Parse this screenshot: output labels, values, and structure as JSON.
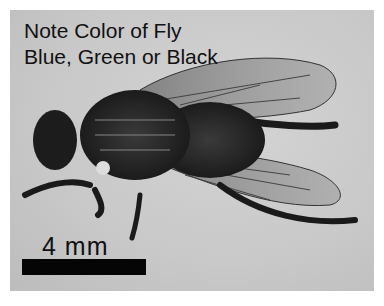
{
  "caption": {
    "line1": "Note Color of Fly",
    "line2": "Blue, Green or Black"
  },
  "scale": {
    "label": "4 mm",
    "bar_color": "#050505"
  }
}
